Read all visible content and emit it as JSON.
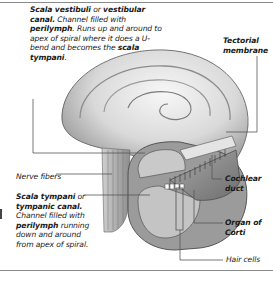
{
  "diagram": {
    "labels": {
      "scala_vestibuli": {
        "term": "Scala vestibuli",
        "conj": " or ",
        "alt_term": "vestibular canal.",
        "desc_1": " Channel filled with ",
        "fluid": "perilymph",
        "desc_2": ". Runs up and around to apex of spiral where it does a U-bend and becomes the ",
        "ref_term": "scala tympani",
        "end": "."
      },
      "tectorial_membrane": {
        "text": "Tectorial membrane"
      },
      "nerve_fibers": {
        "text": "Nerve fibers"
      },
      "scala_tympani": {
        "term": "Scala tympani",
        "conj": " or ",
        "alt_term": "tympanic canal.",
        "desc_1": " Channel filled with ",
        "fluid": "perilymph",
        "desc_2": " running down and around from apex of spiral."
      },
      "cochlear_duct": {
        "text": "Cochlear duct"
      },
      "organ_of_corti": {
        "text": "Organ of Corti"
      },
      "hair_cells": {
        "text": "Hair cells"
      }
    },
    "colors": {
      "leader_line": "#555555",
      "rule": "#8a8a8a",
      "shell_light": "#f2f2f2",
      "shell_mid": "#bdbdbd",
      "shell_dark": "#6f6f6f"
    }
  }
}
